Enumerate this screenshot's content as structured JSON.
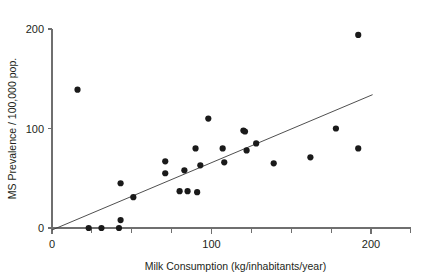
{
  "chart_data": {
    "type": "scatter",
    "title": "",
    "xlabel": "Milk Consumption (kg/inhabitants/year)",
    "ylabel": "MS Prevalence / 100,000 pop.",
    "xlim": [
      0,
      225
    ],
    "ylim": [
      0,
      205
    ],
    "grid": false,
    "legend": null,
    "x_major_ticks": [
      0,
      100,
      200
    ],
    "x_major_tick_labels": [
      "0",
      "100",
      "200"
    ],
    "x_minor_ticks": [
      25,
      50,
      75,
      125,
      150,
      175,
      200,
      225
    ],
    "y_major_ticks": [
      0,
      100,
      200
    ],
    "y_major_tick_labels": [
      "0",
      "100",
      "200"
    ],
    "points": [
      {
        "x": 16,
        "y": 139
      },
      {
        "x": 23,
        "y": 0
      },
      {
        "x": 31,
        "y": 0
      },
      {
        "x": 42,
        "y": 0
      },
      {
        "x": 43,
        "y": 8
      },
      {
        "x": 43,
        "y": 45
      },
      {
        "x": 51,
        "y": 31
      },
      {
        "x": 71,
        "y": 67
      },
      {
        "x": 71,
        "y": 55
      },
      {
        "x": 80,
        "y": 37
      },
      {
        "x": 83,
        "y": 58
      },
      {
        "x": 85,
        "y": 37
      },
      {
        "x": 90,
        "y": 80
      },
      {
        "x": 91,
        "y": 36
      },
      {
        "x": 93,
        "y": 63
      },
      {
        "x": 98,
        "y": 110
      },
      {
        "x": 107,
        "y": 80
      },
      {
        "x": 108,
        "y": 66
      },
      {
        "x": 120,
        "y": 98
      },
      {
        "x": 121,
        "y": 97
      },
      {
        "x": 122,
        "y": 78
      },
      {
        "x": 128,
        "y": 85
      },
      {
        "x": 139,
        "y": 65
      },
      {
        "x": 162,
        "y": 71
      },
      {
        "x": 178,
        "y": 100
      },
      {
        "x": 192,
        "y": 194
      },
      {
        "x": 192,
        "y": 80
      }
    ],
    "trendline": {
      "x0": 0,
      "y0": -2,
      "x1": 201,
      "y1": 134
    },
    "marker_color": "#1a1a1a",
    "line_color": "#3b3b3b",
    "axis_color": "#6f6f6f",
    "text_color": "#231f20",
    "background_color": "#ffffff"
  }
}
